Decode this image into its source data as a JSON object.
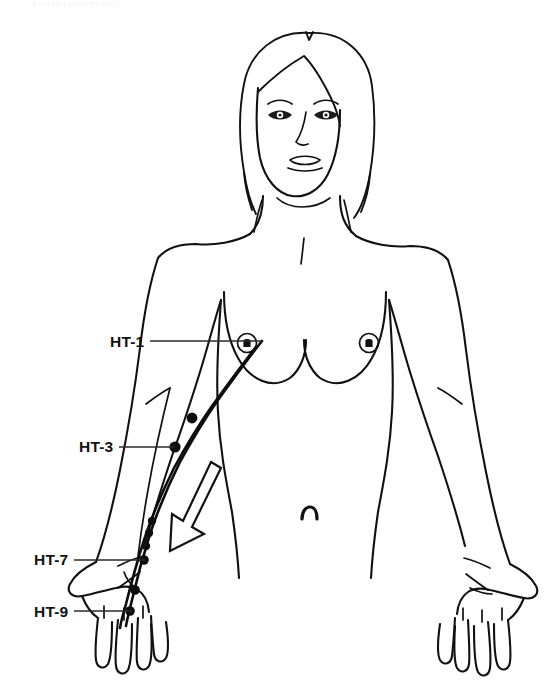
{
  "document": {
    "kind": "anatomical-meridian-chart",
    "view": "anterior-female-torso",
    "cropped_heading_text": "ACUPUNCTURE"
  },
  "colors": {
    "background": "#ffffff",
    "ink": "#111111",
    "label_text": "#121212",
    "leader_line": "#2a2a2a",
    "point_dot": "#0d0d0d",
    "meridian_line": "#0d0d0d",
    "arrow_fill": "#ffffff"
  },
  "meridian": {
    "name": "HT",
    "side": "figure-left-arm",
    "flow_direction": "proximal-to-distal",
    "arrow": {
      "name": "flow-direction-arrow",
      "points_toward": "down-left",
      "style": "hollow-outline"
    }
  },
  "labels": [
    {
      "id": "ht1",
      "text": "HT-1",
      "x": 110,
      "y": 333,
      "leader_to_x": 262,
      "leader_to_y": 341
    },
    {
      "id": "ht3",
      "text": "HT-3",
      "x": 79,
      "y": 438,
      "leader_to_x": 175,
      "leader_to_y": 447
    },
    {
      "id": "ht7",
      "text": "HT-7",
      "x": 34,
      "y": 551,
      "leader_to_x": 145,
      "leader_to_y": 560
    },
    {
      "id": "ht9",
      "text": "HT-9",
      "x": 34,
      "y": 603,
      "leader_to_x": 130,
      "leader_to_y": 611
    }
  ],
  "acupoints": [
    {
      "id": "ht1",
      "label": "HT-1",
      "cx": 262,
      "cy": 341,
      "r": 0,
      "visible_dot": false
    },
    {
      "id": "ht2",
      "label": "HT-2",
      "cx": 192,
      "cy": 418,
      "r": 5.4,
      "visible_dot": true
    },
    {
      "id": "ht3",
      "label": "HT-3",
      "cx": 175,
      "cy": 447,
      "r": 5.6,
      "visible_dot": true
    },
    {
      "id": "ht4",
      "label": "HT-4",
      "cx": 152,
      "cy": 521,
      "r": 4.2,
      "visible_dot": true
    },
    {
      "id": "ht5",
      "label": "HT-5",
      "cx": 149,
      "cy": 533,
      "r": 4.2,
      "visible_dot": true
    },
    {
      "id": "ht6",
      "label": "HT-6",
      "cx": 146,
      "cy": 546,
      "r": 4.2,
      "visible_dot": true
    },
    {
      "id": "ht7",
      "label": "HT-7",
      "cx": 144,
      "cy": 560,
      "r": 4.8,
      "visible_dot": true
    },
    {
      "id": "ht8",
      "label": "HT-8",
      "cx": 135,
      "cy": 590,
      "r": 4.8,
      "visible_dot": true
    },
    {
      "id": "ht9",
      "label": "HT-9",
      "cx": 130,
      "cy": 611,
      "r": 4.8,
      "visible_dot": true
    }
  ],
  "figure_parts": [
    {
      "name": "head"
    },
    {
      "name": "hair"
    },
    {
      "name": "face"
    },
    {
      "name": "left-eye"
    },
    {
      "name": "right-eye"
    },
    {
      "name": "nose"
    },
    {
      "name": "mouth"
    },
    {
      "name": "neck"
    },
    {
      "name": "torso"
    },
    {
      "name": "left-breast"
    },
    {
      "name": "right-breast"
    },
    {
      "name": "navel"
    },
    {
      "name": "left-arm"
    },
    {
      "name": "right-arm"
    },
    {
      "name": "left-hand"
    },
    {
      "name": "right-hand"
    }
  ]
}
